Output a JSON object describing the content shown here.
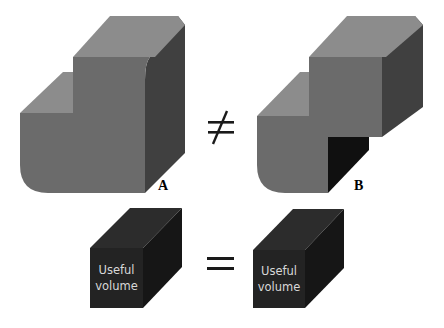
{
  "figure": {
    "shape_a": {
      "label": "A"
    },
    "shape_b": {
      "label": "B"
    },
    "relation_top": "≠",
    "relation_bottom": "=",
    "cube_left": {
      "line1": "Useful",
      "line2": "volume"
    },
    "cube_right": {
      "line1": "Useful",
      "line2": "volume"
    }
  },
  "colors": {
    "top_face": "#8c8c8c",
    "front_face": "#6b6b6b",
    "side_face": "#404040",
    "hollow_face": "#101010",
    "cube_front": "#232323",
    "cube_top": "#2c2c2c",
    "cube_side": "#161616",
    "symbol": "#1a1a1a"
  }
}
